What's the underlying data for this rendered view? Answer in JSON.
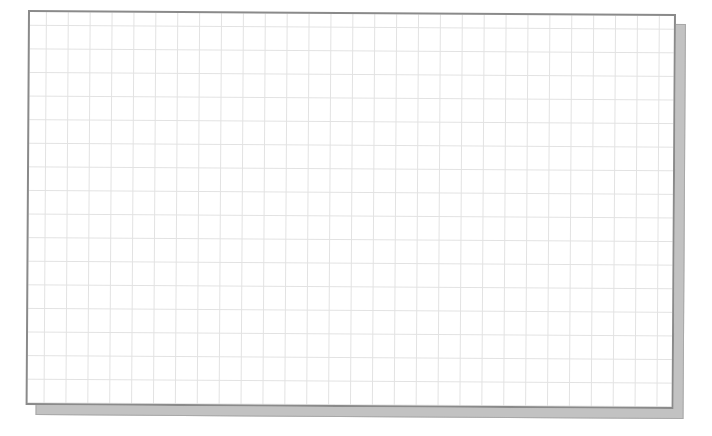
{
  "canvas": {
    "type": "grid-paper",
    "grid": {
      "cell_width_px": 22,
      "cell_height_px": 23.6,
      "columns": 29,
      "rows": 17,
      "line_color": "#e2e2e2"
    },
    "colors": {
      "background": "#ffffff",
      "sheet": "#ffffff",
      "border": "#8a8a8a",
      "shadow": "#c2c2c2"
    }
  }
}
